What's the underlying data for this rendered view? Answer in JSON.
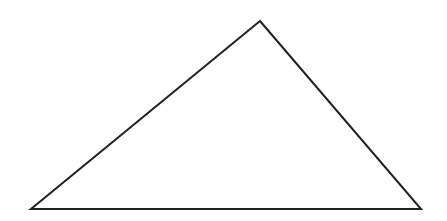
{
  "diagram": {
    "type": "triangle",
    "canvas": {
      "width": 447,
      "height": 221,
      "background": "#ffffff"
    },
    "shape": {
      "vertices": [
        {
          "name": "apex",
          "x": 260,
          "y": 21
        },
        {
          "name": "bottom-left",
          "x": 31,
          "y": 209
        },
        {
          "name": "bottom-right",
          "x": 421,
          "y": 209
        }
      ],
      "stroke": "#222222",
      "stroke_width": 2,
      "fill": "none"
    },
    "points_attr": "260,21 31,209 421,209"
  }
}
